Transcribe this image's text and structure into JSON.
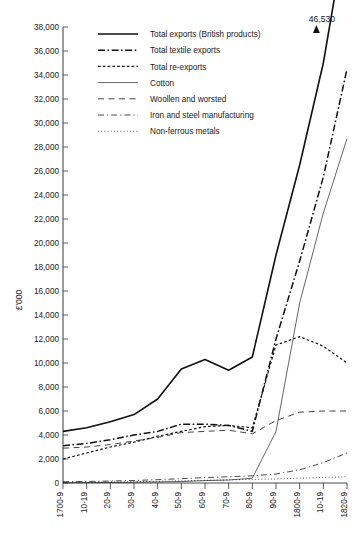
{
  "chart_data": {
    "type": "line",
    "title": "",
    "xlabel": "",
    "ylabel": "£'000",
    "ylim": [
      0,
      38000
    ],
    "ytick_step": 2000,
    "grid": false,
    "legend_position": "top-center",
    "annotations": [
      {
        "text": "46,530",
        "series": "Total exports (British products)",
        "x": "1820-9",
        "note": "arrow above final point, off-scale"
      }
    ],
    "categories": [
      "1700-9",
      "10-19",
      "20-9",
      "30-9",
      "40-9",
      "50-9",
      "60-9",
      "70-9",
      "80-9",
      "90-9",
      "1800-9",
      "10-19",
      "1820-9"
    ],
    "yticks": [
      "0",
      "2,000",
      "4,000",
      "6,000",
      "8,000",
      "10,000",
      "12,000",
      "14,000",
      "16,000",
      "18,000",
      "20,000",
      "22,000",
      "24,000",
      "26,000",
      "28,000",
      "30,000",
      "32,000",
      "34,000",
      "36,000",
      "38,000"
    ],
    "series": [
      {
        "name": "Total exports (British products)",
        "style": "solid-thick",
        "values": [
          4300,
          4600,
          5100,
          5700,
          7000,
          9500,
          10300,
          9400,
          10500,
          19000,
          26500,
          35000,
          46530
        ]
      },
      {
        "name": "Total textile exports",
        "style": "dash-dot",
        "values": [
          3100,
          3300,
          3600,
          4000,
          4300,
          4900,
          4900,
          4800,
          4300,
          12000,
          18500,
          25500,
          34500
        ]
      },
      {
        "name": "Total re-exports",
        "style": "dashed-fine",
        "values": [
          2000,
          2500,
          3000,
          3400,
          3900,
          4300,
          4700,
          4800,
          4600,
          11500,
          12200,
          11400,
          10000
        ]
      },
      {
        "name": "Cotton",
        "style": "solid-thin",
        "values": [
          20,
          30,
          40,
          60,
          90,
          120,
          200,
          250,
          400,
          4300,
          15000,
          22500,
          28700
        ]
      },
      {
        "name": "Woollen and worsted",
        "style": "dashed-long",
        "values": [
          2900,
          3000,
          3200,
          3500,
          3800,
          4200,
          4300,
          4400,
          4100,
          5200,
          5900,
          6000,
          6000
        ]
      },
      {
        "name": "Iron and steel manufacturing",
        "style": "dash-dot-thin",
        "values": [
          100,
          130,
          170,
          210,
          280,
          360,
          450,
          520,
          600,
          750,
          1100,
          1700,
          2500
        ]
      },
      {
        "name": "Non-ferrous metals",
        "style": "dotted-fine",
        "values": [
          60,
          70,
          90,
          110,
          140,
          180,
          220,
          260,
          300,
          340,
          400,
          460,
          520
        ]
      }
    ]
  },
  "legend": {
    "items": [
      {
        "label": "Total exports (British products)"
      },
      {
        "label": "Total textile exports"
      },
      {
        "label": "Total re-exports"
      },
      {
        "label": "Cotton"
      },
      {
        "label": "Woollen and worsted"
      },
      {
        "label": "Iron and steel manufacturing"
      },
      {
        "label": "Non-ferrous metals"
      }
    ]
  },
  "axis": {
    "ylabel": "£'000"
  },
  "annotation": {
    "peak": "46,530"
  },
  "caption": {
    "text": ""
  }
}
